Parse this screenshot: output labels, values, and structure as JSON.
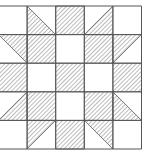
{
  "diagram": {
    "type": "quilt-block",
    "rows": 5,
    "cols": 5,
    "cell_size": 28.6,
    "origin_x": -1.5,
    "origin_y": 6,
    "colors": {
      "line": "#555555",
      "hatch": "#777777",
      "background": "#ffffff"
    },
    "cells": [
      [
        "blank",
        "tri-bl",
        "full",
        "tri-br",
        "blank"
      ],
      [
        "tri-tr",
        "full",
        "blank",
        "full",
        "tri-tl"
      ],
      [
        "full",
        "blank",
        "full",
        "blank",
        "full"
      ],
      [
        "tri-br",
        "full",
        "blank",
        "full",
        "tri-bl"
      ],
      [
        "blank",
        "tri-tl",
        "full",
        "tri-tr",
        "blank"
      ]
    ]
  }
}
